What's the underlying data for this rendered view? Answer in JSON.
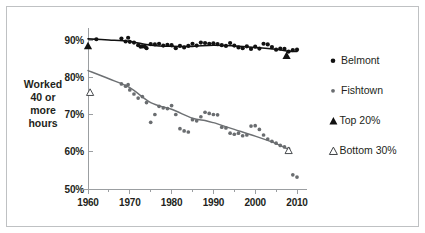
{
  "figure": {
    "background_color": "#ffffff",
    "frame_color": "#bfc1c3"
  },
  "axes": {
    "y_title_lines": [
      "Worked",
      "40 or",
      "more",
      "hours"
    ],
    "y_ticks": [
      "90%",
      "80%",
      "70%",
      "60%",
      "50%"
    ],
    "y_tick_values": [
      90,
      80,
      70,
      60,
      50
    ],
    "x_ticks": [
      "1960",
      "1970",
      "1980",
      "1990",
      "2000",
      "2010"
    ],
    "x_tick_values": [
      1960,
      1970,
      1980,
      1990,
      2000,
      2010
    ],
    "x_minor_values": [
      1965,
      1975,
      1985,
      1995,
      2005
    ]
  },
  "legend": {
    "items": [
      {
        "label": "Belmont",
        "marker": "dot",
        "color": "#111111",
        "icon": "filled-circle-icon"
      },
      {
        "label": "Fishtown",
        "marker": "dot-small",
        "color": "#6a6d70",
        "icon": "filled-circle-icon"
      },
      {
        "label": "Top 20%",
        "marker": "triangle-filled",
        "color": "#111111",
        "icon": "filled-triangle-icon"
      },
      {
        "label": "Bottom 30%",
        "marker": "triangle-open",
        "color": "#ffffff",
        "icon": "open-triangle-icon"
      }
    ]
  },
  "chart_data": {
    "type": "scatter",
    "title": "",
    "xlabel": "",
    "ylabel": "Worked 40 or more hours",
    "xlim": [
      1958,
      2012
    ],
    "ylim": [
      50,
      92
    ],
    "grid": false,
    "legend_position": "right",
    "series": [
      {
        "name": "Belmont",
        "type": "scatter",
        "color": "#111111",
        "marker": "circle",
        "points": [
          [
            1962,
            90.2
          ],
          [
            1968,
            90.4
          ],
          [
            1969,
            89.6
          ],
          [
            1969.6,
            90.6
          ],
          [
            1970,
            89.5
          ],
          [
            1971,
            89.3
          ],
          [
            1972,
            88.6
          ],
          [
            1972.6,
            88.2
          ],
          [
            1973,
            88.3
          ],
          [
            1973.6,
            88.2
          ],
          [
            1974,
            87.8
          ],
          [
            1975,
            88.9
          ],
          [
            1976,
            88.8
          ],
          [
            1977,
            89.0
          ],
          [
            1978,
            88.5
          ],
          [
            1979,
            88.7
          ],
          [
            1980,
            88.6
          ],
          [
            1981,
            87.8
          ],
          [
            1982,
            88.4
          ],
          [
            1983,
            88.0
          ],
          [
            1984,
            88.4
          ],
          [
            1985,
            89.0
          ],
          [
            1986,
            88.5
          ],
          [
            1987,
            89.3
          ],
          [
            1988,
            89.2
          ],
          [
            1989,
            89.0
          ],
          [
            1990,
            89.1
          ],
          [
            1991,
            88.9
          ],
          [
            1992,
            88.6
          ],
          [
            1993,
            88.4
          ],
          [
            1994,
            89.2
          ],
          [
            1995,
            88.5
          ],
          [
            1996,
            88.0
          ],
          [
            1997,
            87.8
          ],
          [
            1998,
            88.3
          ],
          [
            1999,
            87.6
          ],
          [
            2000,
            88.2
          ],
          [
            2001,
            87.7
          ],
          [
            2002,
            89.0
          ],
          [
            2003,
            88.8
          ],
          [
            2004,
            88.1
          ],
          [
            2005,
            87.4
          ],
          [
            2006,
            87.7
          ],
          [
            2007,
            87.6
          ],
          [
            2008,
            86.9
          ],
          [
            2009,
            87.3
          ],
          [
            2010,
            87.4
          ]
        ]
      },
      {
        "name": "Fishtown",
        "type": "scatter",
        "color": "#6a6d70",
        "marker": "circle",
        "points": [
          [
            1968,
            78.2
          ],
          [
            1969,
            77.6
          ],
          [
            1969.6,
            78.0
          ],
          [
            1970,
            76.6
          ],
          [
            1971,
            75.5
          ],
          [
            1972,
            74.4
          ],
          [
            1973,
            74.8
          ],
          [
            1974,
            73.2
          ],
          [
            1975,
            67.9
          ],
          [
            1976,
            70.0
          ],
          [
            1977,
            72.2
          ],
          [
            1978,
            71.8
          ],
          [
            1979,
            71.6
          ],
          [
            1980,
            72.4
          ],
          [
            1981,
            70.0
          ],
          [
            1982,
            66.2
          ],
          [
            1983,
            65.6
          ],
          [
            1984,
            65.3
          ],
          [
            1985,
            68.6
          ],
          [
            1986,
            68.3
          ],
          [
            1987,
            69.4
          ],
          [
            1988,
            70.6
          ],
          [
            1989,
            70.3
          ],
          [
            1990,
            70.0
          ],
          [
            1991,
            69.9
          ],
          [
            1992,
            66.6
          ],
          [
            1993,
            66.4
          ],
          [
            1994,
            65.0
          ],
          [
            1995,
            64.7
          ],
          [
            1996,
            65.0
          ],
          [
            1997,
            64.3
          ],
          [
            1998,
            64.5
          ],
          [
            1999,
            66.9
          ],
          [
            2000,
            67.0
          ],
          [
            2001,
            66.0
          ],
          [
            2002,
            64.5
          ],
          [
            2003,
            63.4
          ],
          [
            2004,
            62.8
          ],
          [
            2005,
            62.3
          ],
          [
            2006,
            61.7
          ],
          [
            2007,
            61.3
          ],
          [
            2008,
            60.8
          ],
          [
            2009,
            53.8
          ],
          [
            2010,
            53.2
          ]
        ]
      }
    ],
    "trend_lines": [
      {
        "name": "Belmont trend",
        "color": "#111111",
        "points": [
          [
            1960,
            90.3
          ],
          [
            1965,
            90.0
          ],
          [
            1970,
            89.6
          ],
          [
            1975,
            88.6
          ],
          [
            1980,
            88.3
          ],
          [
            1985,
            88.3
          ],
          [
            1990,
            88.6
          ],
          [
            1995,
            88.4
          ],
          [
            2000,
            88.0
          ],
          [
            2005,
            87.5
          ],
          [
            2008,
            87.0
          ],
          [
            2010,
            86.9
          ]
        ]
      },
      {
        "name": "Fishtown trend",
        "color": "#6d7073",
        "points": [
          [
            1960,
            81.8
          ],
          [
            1965,
            79.6
          ],
          [
            1970,
            77.2
          ],
          [
            1975,
            73.2
          ],
          [
            1980,
            71.4
          ],
          [
            1985,
            69.0
          ],
          [
            1988,
            68.4
          ],
          [
            1990,
            67.8
          ],
          [
            1995,
            66.0
          ],
          [
            2000,
            64.2
          ],
          [
            2005,
            62.2
          ],
          [
            2008,
            60.6
          ]
        ]
      }
    ],
    "markers": [
      {
        "name": "Top 20% 1960",
        "series": "Top 20%",
        "x": 1960,
        "y": 88.5,
        "style": "triangle-filled"
      },
      {
        "name": "Top 20% 2008",
        "series": "Top 20%",
        "x": 2007.5,
        "y": 85.9,
        "style": "triangle-filled"
      },
      {
        "name": "Bottom 30% 1960",
        "series": "Bottom 30%",
        "x": 1960.5,
        "y": 76.0,
        "style": "triangle-open"
      },
      {
        "name": "Bottom 30% 2008",
        "series": "Bottom 30%",
        "x": 2008,
        "y": 60.4,
        "style": "triangle-open"
      }
    ]
  }
}
